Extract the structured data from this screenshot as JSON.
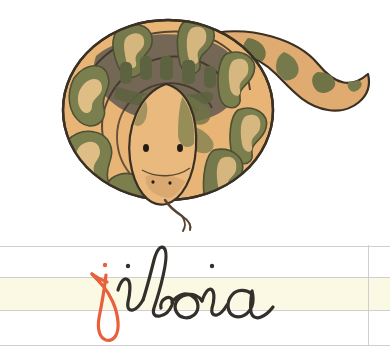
{
  "page": {
    "width": 390,
    "height": 361,
    "background_color": "#ffffff",
    "kind": "handwriting-practice-flashcard"
  },
  "illustration": {
    "name": "snake-illustration",
    "subject": "jiboia",
    "description": "Coiled ball python / boa constrictor seen from above with head resting forward and forked tongue out",
    "colors": {
      "body_base": "#e8b173",
      "body_base_light": "#f0c98f",
      "blotch_green": "#7b7f4e",
      "blotch_green_dark": "#6a6e43",
      "saddle_shadow": "#6e6353",
      "outline": "#3b3024",
      "belly_highlight": "#f3d7a4",
      "tongue": "#554433",
      "eye": "#241c14"
    }
  },
  "ruled_paper": {
    "name": "handwriting-guide-lines",
    "line_color": "#cfcfcf",
    "xheight_band_color": "#fbf8e3",
    "line_count": 4,
    "right_margin": true
  },
  "word": {
    "text": "jiboia",
    "script_style": "cursive",
    "letters": [
      {
        "char": "j",
        "color": "#e8603c",
        "role": "target-letter"
      },
      {
        "char": "i",
        "color": "#332f2a",
        "role": "body"
      },
      {
        "char": "b",
        "color": "#332f2a",
        "role": "body"
      },
      {
        "char": "o",
        "color": "#332f2a",
        "role": "body"
      },
      {
        "char": "i",
        "color": "#332f2a",
        "role": "body"
      },
      {
        "char": "a",
        "color": "#332f2a",
        "role": "body"
      }
    ],
    "highlight_color": "#e8603c",
    "ink_color": "#332f2a"
  }
}
